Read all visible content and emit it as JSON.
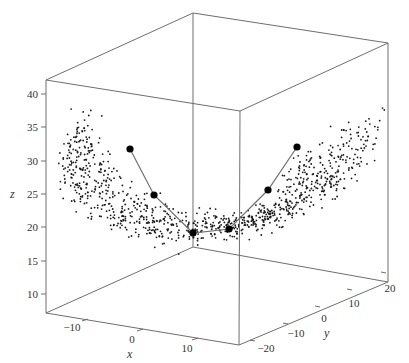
{
  "chart_data": {
    "type": "scatter",
    "subtype": "3d-scatter",
    "title": "",
    "xlabel": "x",
    "ylabel": "y",
    "zlabel": "z",
    "xlim": [
      -15,
      15
    ],
    "ylim": [
      -22,
      22
    ],
    "zlim": [
      8,
      42
    ],
    "x_ticks": [
      "−10",
      "0",
      "10"
    ],
    "y_ticks": [
      "−20",
      "−10",
      "0",
      "10",
      "20"
    ],
    "z_ticks": [
      "10",
      "15",
      "20",
      "25",
      "30",
      "35",
      "40"
    ],
    "grid": false,
    "legend": null,
    "point_count_estimate": 1000,
    "highlighted_path": {
      "points_screen": [
        [
          130,
          149
        ],
        [
          154,
          195
        ],
        [
          193,
          233
        ],
        [
          229,
          229
        ],
        [
          268,
          190
        ],
        [
          297,
          147
        ]
      ],
      "approx_z": [
        31,
        25,
        20,
        20,
        26,
        31
      ]
    },
    "colors": {
      "points": "#000000",
      "path_line": "#707070",
      "box": "#6e6e6e"
    }
  },
  "axes": {
    "x_label": "x",
    "y_label": "y",
    "z_label": "z",
    "x_ticks": [
      {
        "label": "−10",
        "x": 72,
        "y": 331
      },
      {
        "label": "0",
        "x": 132,
        "y": 343
      },
      {
        "label": "10",
        "x": 187,
        "y": 352
      }
    ],
    "y_ticks": [
      {
        "label": "−20",
        "x": 266,
        "y": 352
      },
      {
        "label": "−10",
        "x": 296,
        "y": 337
      },
      {
        "label": "0",
        "x": 324,
        "y": 322
      },
      {
        "label": "10",
        "x": 354,
        "y": 307
      },
      {
        "label": "20",
        "x": 390,
        "y": 292
      }
    ],
    "z_ticks": [
      {
        "label": "40",
        "y": 94
      },
      {
        "label": "35",
        "y": 127
      },
      {
        "label": "30",
        "y": 161
      },
      {
        "label": "25",
        "y": 194
      },
      {
        "label": "20",
        "y": 227
      },
      {
        "label": "15",
        "y": 261
      },
      {
        "label": "10",
        "y": 294
      }
    ]
  },
  "box": {
    "top_back_left": [
      46,
      80
    ],
    "top_back_mid": [
      193,
      13
    ],
    "top_back_right": [
      388,
      43
    ],
    "top_front": [
      240,
      111
    ],
    "bottom_left": [
      46,
      313
    ],
    "bottom_back_mid": [
      193,
      247
    ],
    "bottom_right": [
      388,
      282
    ],
    "bottom_front": [
      239,
      345
    ]
  },
  "generator": {
    "seed": 7,
    "n": 1000
  }
}
